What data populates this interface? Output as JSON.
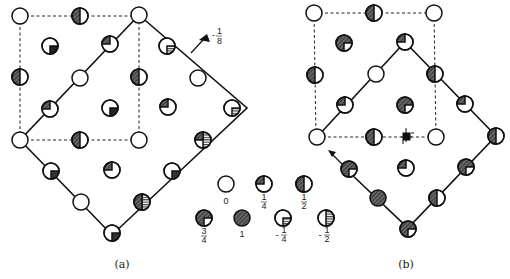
{
  "figure": {
    "panels": [
      {
        "id": "a",
        "caption": "(a)"
      },
      {
        "id": "b",
        "caption": "(b)"
      }
    ],
    "annotation_a": {
      "label": "-1/8",
      "num": "1",
      "den": "8",
      "sign": "-"
    },
    "legend": {
      "items": [
        {
          "value": "0",
          "fill": "none"
        },
        {
          "value": "1/4",
          "sign": "",
          "num": "1",
          "den": "4",
          "fill": "quarter"
        },
        {
          "value": "1/2",
          "sign": "",
          "num": "1",
          "den": "2",
          "fill": "half"
        },
        {
          "value": "3/4",
          "sign": "",
          "num": "3",
          "den": "4",
          "fill": "three-quarter"
        },
        {
          "value": "1",
          "fill": "full"
        },
        {
          "value": "-1/4",
          "sign": "-",
          "num": "1",
          "den": "4",
          "fill": "neg-quarter"
        },
        {
          "value": "-1/2",
          "sign": "-",
          "num": "1",
          "den": "2",
          "fill": "neg-half"
        }
      ]
    },
    "colors": {
      "ink": "#1a1a1a",
      "shade": "#555555",
      "background": "#ffffff"
    }
  }
}
